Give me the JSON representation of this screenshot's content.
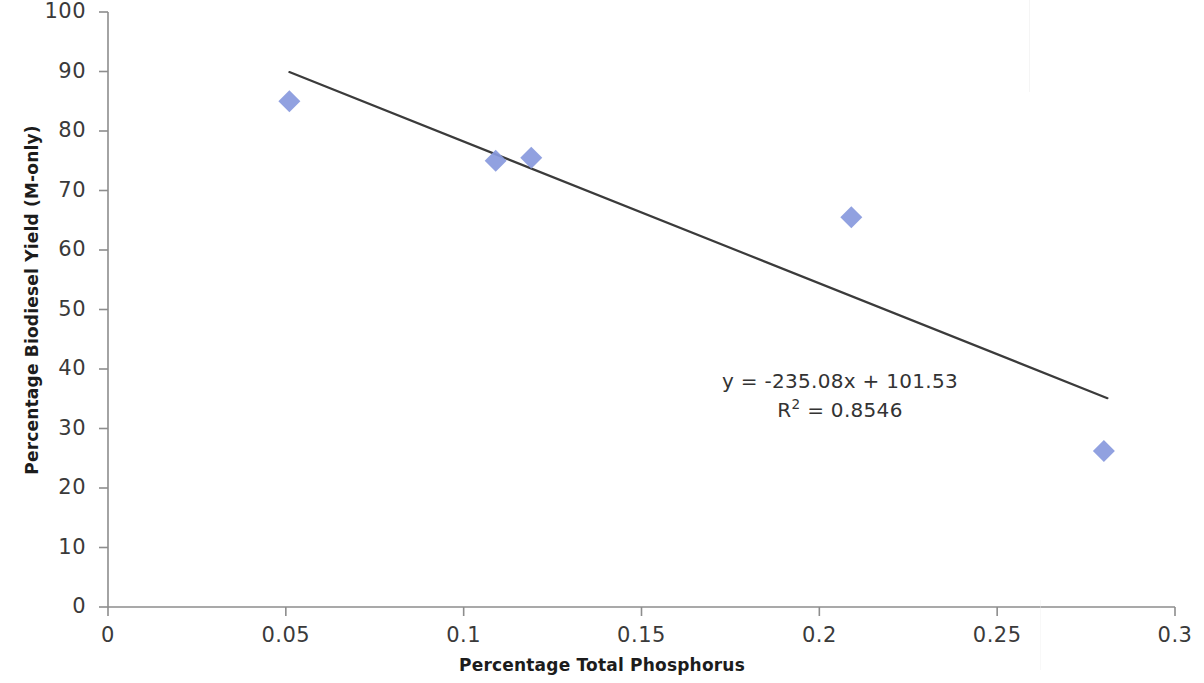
{
  "chart_data": {
    "type": "scatter",
    "title": "",
    "xlabel": "Percentage Total Phosphorus",
    "ylabel": "Percentage Biodiesel Yield (M-only)",
    "xlim": [
      0,
      0.3
    ],
    "ylim": [
      0,
      100
    ],
    "xticks": [
      "0",
      "0.05",
      "0.1",
      "0.15",
      "0.2",
      "0.25",
      "0.3"
    ],
    "xtick_values": [
      0,
      0.05,
      0.1,
      0.15,
      0.2,
      0.25,
      0.3
    ],
    "yticks": [
      "0",
      "10",
      "20",
      "30",
      "40",
      "50",
      "60",
      "70",
      "80",
      "90",
      "100"
    ],
    "ytick_values": [
      0,
      10,
      20,
      30,
      40,
      50,
      60,
      70,
      80,
      90,
      100
    ],
    "grid": false,
    "legend": "none",
    "marker_shape": "diamond",
    "marker_color": "#8899DD",
    "trendline_color": "#3b3b3b",
    "series": [
      {
        "name": "Percentage Biodiesel Yield (M-only)",
        "x": [
          0.051,
          0.109,
          0.119,
          0.209,
          0.28
        ],
        "y": [
          85.0,
          75.0,
          75.5,
          65.5,
          26.2
        ]
      }
    ],
    "trendline": {
      "equation": "y = -235.08x + 101.53",
      "r_squared_label": "R",
      "r_squared_exponent": "2",
      "r_squared_value": " = 0.8546",
      "slope": -235.08,
      "intercept": 101.53,
      "r_squared": 0.8546,
      "x_start": 0.051,
      "x_end": 0.281,
      "y_start": 89.9,
      "y_end": 35.1
    }
  }
}
